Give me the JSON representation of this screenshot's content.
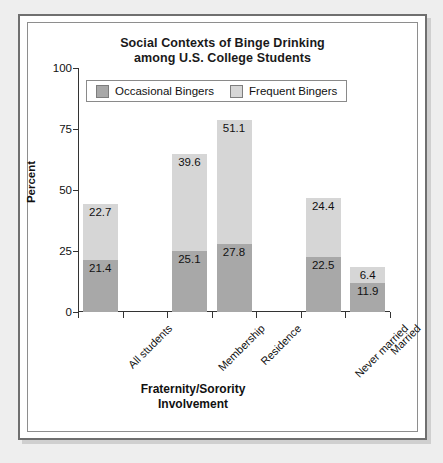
{
  "chart_data": {
    "type": "bar",
    "subtype": "stacked-bar",
    "title": "Social Contexts of Binge Drinking among U.S. College Students",
    "title_line1": "Social Contexts of Binge Drinking",
    "title_line2": "among U.S. College Students",
    "xlabel": "Fraternity/Sorority Involvement",
    "xlabel_line1": "Fraternity/Sorority",
    "xlabel_line2": "Involvement",
    "ylabel": "Percent",
    "ylim": [
      0,
      100
    ],
    "yticks": [
      0,
      25,
      50,
      75,
      100
    ],
    "ytick_labels": [
      "0",
      "25",
      "50",
      "75",
      "100"
    ],
    "grid": false,
    "legend_position": "top-left-inside",
    "categories": [
      "All students",
      "Membership",
      "Residence",
      "Never married",
      "Married"
    ],
    "category_slots": [
      0,
      2,
      3,
      5,
      6
    ],
    "series": [
      {
        "name": "Occasional Bingers",
        "color": "#a8a8a8",
        "values": [
          21.4,
          25.1,
          27.8,
          22.5,
          11.9
        ]
      },
      {
        "name": "Frequent Bingers",
        "color": "#d6d6d6",
        "values": [
          22.7,
          39.6,
          51.1,
          24.4,
          6.4
        ]
      }
    ],
    "stack_totals": [
      44.1,
      64.7,
      78.9,
      46.9,
      18.3
    ]
  },
  "legend": {
    "entries": [
      {
        "label": "Occasional Bingers",
        "color": "#a8a8a8"
      },
      {
        "label": "Frequent Bingers",
        "color": "#d6d6d6"
      }
    ]
  },
  "colors": {
    "occasional": "#a8a8a8",
    "frequent": "#d6d6d6",
    "axis": "#333333",
    "page_background": "#eeeeee",
    "plot_background": "#ffffff",
    "frame_border": "#6f6f6f"
  }
}
